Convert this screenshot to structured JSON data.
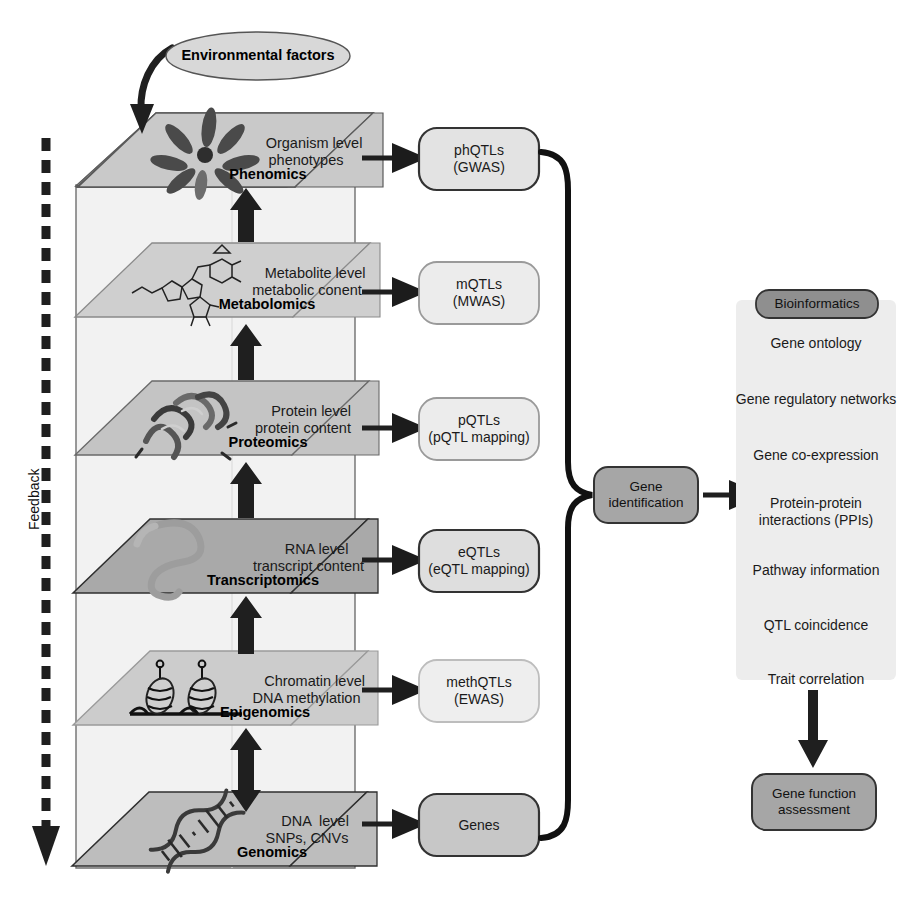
{
  "figure": {
    "env_node": {
      "label": "Environmental factors"
    },
    "feedback": {
      "label": "Feedback"
    }
  },
  "omics_layers": [
    {
      "id": "phenomics",
      "name": "Phenomics",
      "desc_line1": "Organism level",
      "desc_line2": "phenotypes",
      "icon": "plant-rosette-icon",
      "plane_fill": "#c9c9c9"
    },
    {
      "id": "metabolomics",
      "name": "Metabolomics",
      "desc_line1": "Metabolite level",
      "desc_line2": "metabolic conent",
      "icon": "metabolite-structure-icon",
      "plane_fill": "#cfcfcf"
    },
    {
      "id": "proteomics",
      "name": "Proteomics",
      "desc_line1": "Protein level",
      "desc_line2": "protein content",
      "icon": "protein-ribbon-icon",
      "plane_fill": "#c4c4c4"
    },
    {
      "id": "transcriptomics",
      "name": "Transcriptomics",
      "desc_line1": "RNA level",
      "desc_line2": "transcript content",
      "icon": "rna-strand-icon",
      "plane_fill": "#a9a9a9"
    },
    {
      "id": "epigenomics",
      "name": "Epigenomics",
      "desc_line1": "Chromatin level",
      "desc_line2": "DNA methylation",
      "icon": "nucleosome-icon",
      "plane_fill": "#cccccc"
    },
    {
      "id": "genomics",
      "name": "Genomics",
      "desc_line1": "DNA  level",
      "desc_line2": "SNPs, CNVs",
      "icon": "dna-helix-icon",
      "plane_fill": "#bdbdbd"
    }
  ],
  "qtl_boxes": [
    {
      "id": "phqtls",
      "line1": "phQTLs",
      "line2": "(GWAS)",
      "fill": "#e3e3e3",
      "stroke": "#333333"
    },
    {
      "id": "mqtls",
      "line1": "mQTLs",
      "line2": "(MWAS)",
      "fill": "#ececec",
      "stroke": "#9a9a9a"
    },
    {
      "id": "pqtls",
      "line1": "pQTLs",
      "line2": "(pQTL mapping)",
      "fill": "#ececec",
      "stroke": "#9a9a9a"
    },
    {
      "id": "eqtls",
      "line1": "eQTLs",
      "line2": "(eQTL mapping)",
      "fill": "#dedede",
      "stroke": "#333333"
    },
    {
      "id": "methqtls",
      "line1": "methQTLs",
      "line2": "(EWAS)",
      "fill": "#eeeeee",
      "stroke": "#bdbdbd"
    },
    {
      "id": "genes",
      "line1": "Genes",
      "line2": "",
      "fill": "#c7c7c7",
      "stroke": "#333333"
    }
  ],
  "gene_identification": {
    "line1": "Gene",
    "line2": "identification",
    "fill": "#a6a6a6"
  },
  "bioinformatics_panel": {
    "title": "Bioinformatics",
    "title_fill": "#8f8f8f",
    "panel_fill": "#ededed",
    "items": [
      {
        "line1": "Gene ontology",
        "line2": ""
      },
      {
        "line1": "Gene regulatory networks",
        "line2": ""
      },
      {
        "line1": "Gene co-expression",
        "line2": ""
      },
      {
        "line1": "Protein-protein",
        "line2": "interactions (PPIs)"
      },
      {
        "line1": "Pathway information",
        "line2": ""
      },
      {
        "line1": "QTL coincidence",
        "line2": ""
      },
      {
        "line1": "Trait correlation",
        "line2": ""
      }
    ]
  },
  "gene_function": {
    "line1": "Gene function",
    "line2": "assessment",
    "fill": "#a6a6a6"
  },
  "colors": {
    "arrow_dark": "#1c1c1c",
    "plane_edge": "#555555",
    "wall_fill": "#efefef",
    "wall_edge": "#777777",
    "text": "#1a1a1a"
  }
}
